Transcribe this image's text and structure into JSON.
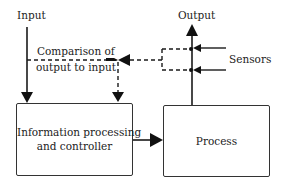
{
  "diagram": {
    "labels": {
      "input": "Input",
      "output": "Output",
      "comparison_line1": "Comparison of",
      "comparison_line2": "output to input",
      "sensors": "Sensors"
    },
    "nodes": [
      {
        "id": "controller",
        "line1": "Information processing",
        "line2": "and controller"
      },
      {
        "id": "process",
        "label": "Process"
      }
    ],
    "edges": [
      {
        "from": "input",
        "to": "controller",
        "style": "solid"
      },
      {
        "from": "controller",
        "to": "process",
        "style": "solid"
      },
      {
        "from": "process",
        "to": "output",
        "style": "solid"
      },
      {
        "from": "sensors",
        "to": "output-line",
        "style": "solid"
      },
      {
        "from": "output-line",
        "to": "comparator",
        "style": "dashed"
      },
      {
        "from": "input-line",
        "to": "comparator",
        "style": "dashed"
      },
      {
        "from": "comparator",
        "to": "controller",
        "style": "dashed"
      }
    ],
    "colors": {
      "line": "#1a1a1a",
      "text": "#222222",
      "background": "#ffffff"
    }
  }
}
